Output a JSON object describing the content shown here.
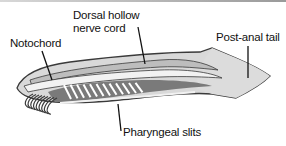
{
  "diagram": {
    "labels": {
      "notochord": "Notochord",
      "nerve_cord_line1": "Dorsal hollow",
      "nerve_cord_line2": "nerve cord",
      "post_anal_tail": "Post-anal tail",
      "pharyngeal_slits": "Pharyngeal slits"
    },
    "colors": {
      "outline": "#3a3a3a",
      "body_fill": "#d9d9d9",
      "nerve_cord": "#bdbdbd",
      "notochord": "#f2f2f2",
      "pharynx": "#7a7a7a",
      "slits": "#ffffff",
      "leader_lines": "#111111"
    },
    "slit_count": 12,
    "tentacle_count": 9
  }
}
